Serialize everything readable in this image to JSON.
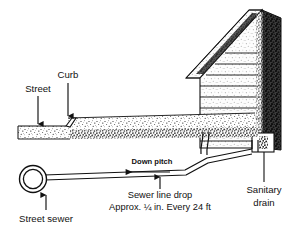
{
  "figure": {
    "type": "technical-illustration"
  },
  "labels": {
    "street": "Street",
    "curb": "Curb",
    "down_pitch": "Down pitch",
    "sewer_line_drop": "Sewer line drop",
    "sewer_line_spec": "Approx. ¼ in. Every 24 ft",
    "street_sewer": "Street sewer",
    "sanitary_drain_line1": "Sanitary",
    "sanitary_drain_line2": "drain"
  },
  "colors": {
    "ink": "#111111",
    "ground_fill": "#9a9a9a",
    "siding_fill": "#cfcfcf",
    "shadow_fill": "#2b2b2b",
    "background": "#ffffff"
  },
  "specs": {
    "drop_amount": "¼ in.",
    "drop_interval": "24 ft",
    "pitch_direction": "down toward street sewer"
  }
}
